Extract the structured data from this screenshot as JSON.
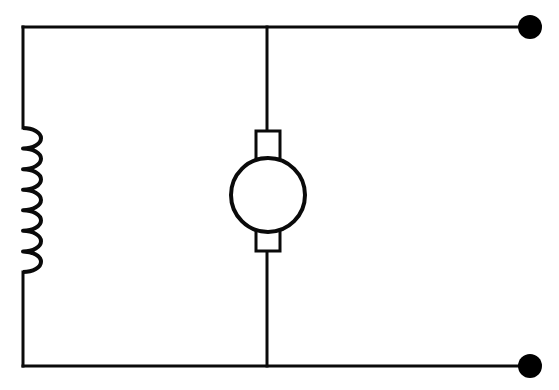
{
  "diagram": {
    "type": "electrical-schematic",
    "background_color": "#ffffff",
    "line_color": "#000000",
    "canvas": {
      "width": 559,
      "height": 390
    }
  },
  "style": {
    "wire_stroke_width": 3,
    "coil_stroke_width": 4,
    "motor_stroke_width": 4,
    "brush_stroke_width": 3
  },
  "nodes": {
    "top_left_corner": {
      "x": 23,
      "y": 27
    },
    "bottom_left_corner": {
      "x": 23,
      "y": 366
    },
    "top_junction": {
      "x": 267,
      "y": 27
    },
    "bottom_junction": {
      "x": 267,
      "y": 366
    },
    "top_terminal": {
      "x": 530,
      "y": 27,
      "radius": 12,
      "label": "terminal-1"
    },
    "bottom_terminal": {
      "x": 530,
      "y": 366,
      "radius": 12,
      "label": "terminal-2"
    }
  },
  "wires": {
    "top_rail": {
      "x1": 23,
      "y1": 27,
      "x2": 530,
      "y2": 27
    },
    "bottom_rail": {
      "x1": 23,
      "y1": 366,
      "x2": 530,
      "y2": 366
    },
    "left_rail_upper": {
      "x1": 23,
      "y1": 27,
      "x2": 23,
      "y2": 128
    },
    "left_rail_lower": {
      "x1": 23,
      "y1": 272,
      "x2": 23,
      "y2": 366
    },
    "motor_lead_top": {
      "x1": 267,
      "y1": 27,
      "x2": 267,
      "y2": 131
    },
    "motor_lead_bottom": {
      "x1": 267,
      "y1": 250,
      "x2": 267,
      "y2": 366
    }
  },
  "components": {
    "inductor": {
      "name": "inductor",
      "symbol": "coil",
      "orientation": "vertical",
      "loop_count": 7,
      "axis_x": 23,
      "bulge_x": 41,
      "y_start": 128,
      "y_end": 272,
      "loop_pitch": 20.57
    },
    "motor": {
      "name": "motor",
      "symbol": "circle-with-brushes",
      "center": {
        "x": 268,
        "y": 195
      },
      "radius": 37,
      "brush_top": {
        "x": 256,
        "y": 131,
        "width": 24,
        "height": 28
      },
      "brush_bottom": {
        "x": 256,
        "y": 228,
        "width": 24,
        "height": 23
      }
    }
  },
  "colors": {
    "stroke": "#0a0a0a",
    "fill": "#ffffff",
    "terminal": "#000000"
  }
}
